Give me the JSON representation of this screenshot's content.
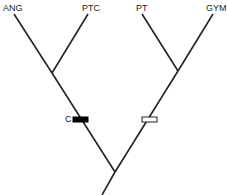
{
  "diagram": {
    "type": "phylogenetic-tree",
    "taxa": [
      {
        "label": "ANG"
      },
      {
        "label": "PTC"
      },
      {
        "label": "PT"
      },
      {
        "label": "GYM"
      }
    ],
    "characters": [
      {
        "label": "C",
        "state": "derived",
        "fill": "#000000",
        "branch": "ANG+PTC"
      },
      {
        "label": "",
        "state": "ancestral",
        "fill": "#ffffff",
        "branch": "PT+GYM"
      }
    ],
    "colors": {
      "line": "#222222"
    }
  }
}
